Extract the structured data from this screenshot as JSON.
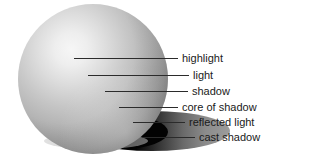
{
  "figure": {
    "background_color": "#ffffff",
    "sphere": {
      "cx": 93,
      "cy": 79,
      "r": 75,
      "highlight_cx": 66,
      "highlight_cy": 63,
      "base_color": "#b4b4b4",
      "highlight_color": "#f2f2f2",
      "core_shadow_color": "#6e6e6e",
      "edge_color": "#9a9a9a"
    },
    "cast_shadow": {
      "cx": 152,
      "cy": 131,
      "rx": 78,
      "ry": 20,
      "dark_color": "#000000",
      "light_color": "#8c8c8c"
    },
    "labels": [
      {
        "id": "highlight",
        "text": "highlight",
        "text_x": 182,
        "text_y": 62,
        "line_x1": 74,
        "line_x2": 178,
        "line_y": 58
      },
      {
        "id": "light",
        "text": "light",
        "text_x": 193,
        "text_y": 79,
        "line_x1": 88,
        "line_x2": 189,
        "line_y": 75
      },
      {
        "id": "shadow",
        "text": "shadow",
        "text_x": 192,
        "text_y": 95,
        "line_x1": 105,
        "line_x2": 188,
        "line_y": 91
      },
      {
        "id": "core-of-shadow",
        "text": "core of shadow",
        "text_x": 182,
        "text_y": 111,
        "line_x1": 119,
        "line_x2": 178,
        "line_y": 107
      },
      {
        "id": "reflected-light",
        "text": "reflected light",
        "text_x": 189,
        "text_y": 126,
        "line_x1": 133,
        "line_x2": 185,
        "line_y": 122
      },
      {
        "id": "cast-shadow",
        "text": "cast shadow",
        "text_x": 199,
        "text_y": 141,
        "line_x1": 143,
        "line_x2": 195,
        "line_y": 137
      }
    ]
  }
}
